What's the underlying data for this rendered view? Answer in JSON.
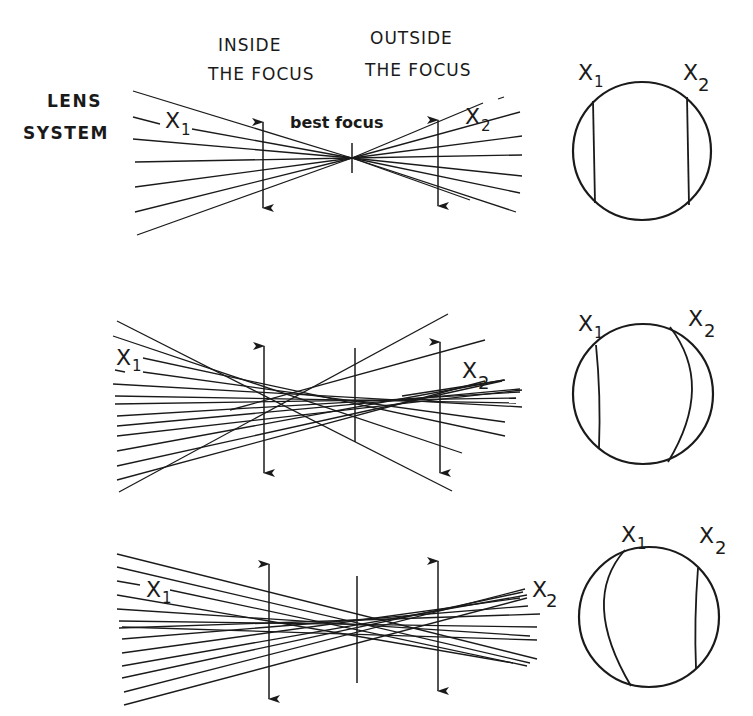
{
  "headers": {
    "inside_line1": "INSIDE",
    "inside_line2": "THE FOCUS",
    "outside_line1": "OUTSIDE",
    "outside_line2": "THE FOCUS",
    "lens_line1": "LENS",
    "lens_line2": "SYSTEM"
  },
  "panels": [
    {
      "id": "perfect",
      "x1_label": "X",
      "x1_sub": "1",
      "x2_label": "X",
      "x2_sub": "2",
      "focus_label": "best focus",
      "circle_x1_label": "X",
      "circle_x1_sub": "1",
      "circle_x2_label": "X",
      "circle_x2_sub": "2"
    },
    {
      "id": "aberration-a",
      "x1_label": "X",
      "x1_sub": "1",
      "x2_label": "X",
      "x2_sub": "2",
      "circle_x1_label": "X",
      "circle_x1_sub": "1",
      "circle_x2_label": "X",
      "circle_x2_sub": "2"
    },
    {
      "id": "aberration-b",
      "x1_label": "X",
      "x1_sub": "1",
      "x2_label": "X",
      "x2_sub": "2",
      "circle_x1_label": "X",
      "circle_x1_sub": "1",
      "circle_x2_label": "X",
      "circle_x2_sub": "2"
    }
  ]
}
